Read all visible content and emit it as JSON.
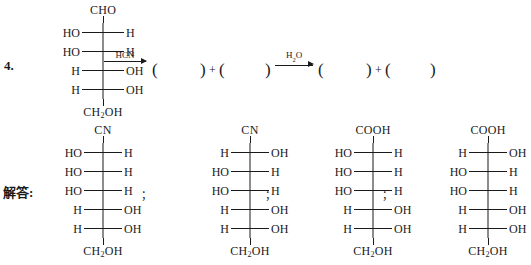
{
  "problem": {
    "number": "4.",
    "answer_label": "解答:"
  },
  "reaction": {
    "reagent1": "HCN",
    "reagent2_pre": "H",
    "reagent2_sub": "2",
    "reagent2_post": "O",
    "plus": "+",
    "paren_open": "(",
    "paren_close": ")"
  },
  "separators": [
    "；",
    "；",
    "；"
  ],
  "structures": {
    "reactant": {
      "name": "reactant-fischer",
      "top": "CHO",
      "bottom_pre": "CH",
      "bottom_sub": "2",
      "bottom_post": "OH",
      "rows": [
        {
          "left": "HO",
          "right": "H"
        },
        {
          "left": "HO",
          "right": "H"
        },
        {
          "left": "H",
          "right": "OH"
        },
        {
          "left": "H",
          "right": "OH"
        }
      ]
    },
    "products": [
      {
        "name": "product-nitrile-1",
        "top": "CN",
        "bottom_pre": "CH",
        "bottom_sub": "2",
        "bottom_post": "OH",
        "rows": [
          {
            "left": "HO",
            "right": "H"
          },
          {
            "left": "HO",
            "right": "H"
          },
          {
            "left": "HO",
            "right": "H"
          },
          {
            "left": "H",
            "right": "OH"
          },
          {
            "left": "H",
            "right": "OH"
          }
        ]
      },
      {
        "name": "product-nitrile-2",
        "top": "CN",
        "bottom_pre": "CH",
        "bottom_sub": "2",
        "bottom_post": "OH",
        "rows": [
          {
            "left": "H",
            "right": "OH"
          },
          {
            "left": "HO",
            "right": "H"
          },
          {
            "left": "HO",
            "right": "H"
          },
          {
            "left": "H",
            "right": "OH"
          },
          {
            "left": "H",
            "right": "OH"
          }
        ]
      },
      {
        "name": "product-acid-1",
        "top": "COOH",
        "bottom_pre": "CH",
        "bottom_sub": "2",
        "bottom_post": "OH",
        "rows": [
          {
            "left": "HO",
            "right": "H"
          },
          {
            "left": "HO",
            "right": "H"
          },
          {
            "left": "HO",
            "right": "H"
          },
          {
            "left": "H",
            "right": "OH"
          },
          {
            "left": "H",
            "right": "OH"
          }
        ]
      },
      {
        "name": "product-acid-2",
        "top": "COOH",
        "bottom_pre": "CH",
        "bottom_sub": "2",
        "bottom_post": "OH",
        "rows": [
          {
            "left": "H",
            "right": "OH"
          },
          {
            "left": "HO",
            "right": "H"
          },
          {
            "left": "HO",
            "right": "H"
          },
          {
            "left": "H",
            "right": "OH"
          },
          {
            "left": "H",
            "right": "OH"
          }
        ]
      }
    ]
  },
  "colors": {
    "ink": "#1a1a1a",
    "background": "#ffffff"
  }
}
